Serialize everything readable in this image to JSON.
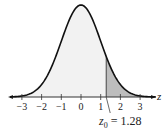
{
  "chart_data": {
    "type": "area",
    "title": "",
    "xlabel": "z",
    "ylabel": "",
    "xlim": [
      -3.6,
      3.8
    ],
    "ticks": [
      -3,
      -2,
      -1,
      0,
      1,
      2,
      3
    ],
    "tick_labels": [
      "−3",
      "−2",
      "−1",
      "0",
      "1",
      "2",
      "3"
    ],
    "mean": 0,
    "sd": 1,
    "shaded_region": {
      "from": 1.28,
      "to": 3.8,
      "color": "#bdbdbd"
    },
    "unshaded_fill": "#f2f2f2",
    "curve_color": "#111111",
    "annotation": {
      "label_main": "z",
      "label_sub": "0",
      "label_rest": " = 1.28",
      "value": 1.28
    },
    "grid": false,
    "legend": null
  },
  "axis": {
    "label": "z"
  }
}
